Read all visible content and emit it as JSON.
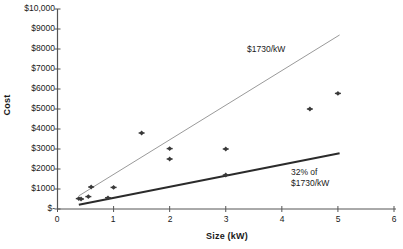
{
  "chart_data": {
    "type": "scatter",
    "title": "",
    "xlabel": "Size (kW)",
    "ylabel": "Cost",
    "xlim": [
      0,
      6
    ],
    "ylim": [
      0,
      10000
    ],
    "grid": false,
    "legend": "none",
    "x_ticks": [
      "0",
      "1",
      "2",
      "3",
      "4",
      "5",
      "6"
    ],
    "x_tick_values": [
      0,
      1,
      2,
      3,
      4,
      5,
      6
    ],
    "y_ticks": [
      "$-",
      "$1000",
      "$2000",
      "$3000",
      "$4000",
      "$5000",
      "$6000",
      "$7000",
      "$8000",
      "$9000",
      "$10,000"
    ],
    "y_tick_values": [
      0,
      1000,
      2000,
      3000,
      4000,
      5000,
      6000,
      7000,
      8000,
      9000,
      10000
    ],
    "series": [
      {
        "name": "Observed systems",
        "type": "scatter",
        "marker": "diamond",
        "color": "#3a3a3a",
        "points": [
          {
            "x": 0.38,
            "y": 520
          },
          {
            "x": 0.42,
            "y": 500
          },
          {
            "x": 0.55,
            "y": 620
          },
          {
            "x": 0.6,
            "y": 1100
          },
          {
            "x": 0.9,
            "y": 560
          },
          {
            "x": 1.0,
            "y": 1080
          },
          {
            "x": 1.5,
            "y": 3800
          },
          {
            "x": 2.0,
            "y": 3020
          },
          {
            "x": 2.0,
            "y": 2500
          },
          {
            "x": 3.0,
            "y": 3000
          },
          {
            "x": 3.0,
            "y": 1700
          },
          {
            "x": 4.5,
            "y": 5000
          },
          {
            "x": 5.0,
            "y": 5780
          }
        ]
      },
      {
        "name": "$1730/kW",
        "type": "line",
        "color": "#9a9a9a",
        "slope": 1730,
        "x_range": [
          0.38,
          5.03
        ],
        "y_range": [
          657,
          8702
        ]
      },
      {
        "name": "32% of $1730/kW",
        "type": "line",
        "color": "#2b2b2b",
        "slope": 553.6,
        "x_range": [
          0.38,
          5.03
        ],
        "y_range": [
          210,
          2785
        ]
      }
    ],
    "annotations": [
      {
        "text": "$1730/kW",
        "x": 3.4,
        "y": 8200
      },
      {
        "text": "32% of\n$1730/kW",
        "x": 4.2,
        "y": 2100
      }
    ]
  },
  "axes": {
    "y_title": "Cost",
    "x_title": "Size (kW)",
    "y_tick_labels": [
      "$10,000",
      "$9000",
      "$8000",
      "$7000",
      "$6000",
      "$5000",
      "$4000",
      "$3000",
      "$2000",
      "$1000",
      "$-"
    ],
    "x_tick_labels": [
      "0",
      "1",
      "2",
      "3",
      "4",
      "5",
      "6"
    ]
  },
  "annotations": {
    "upper_line_label": "$1730/kW",
    "lower_line_label": "32% of\n$1730/kW"
  },
  "colors": {
    "upper_line": "#9a9a9a",
    "lower_line": "#2b2b2b",
    "marker": "#3a3a3a",
    "axis": "#555555",
    "text": "#1a1a1a",
    "background": "#ffffff"
  }
}
